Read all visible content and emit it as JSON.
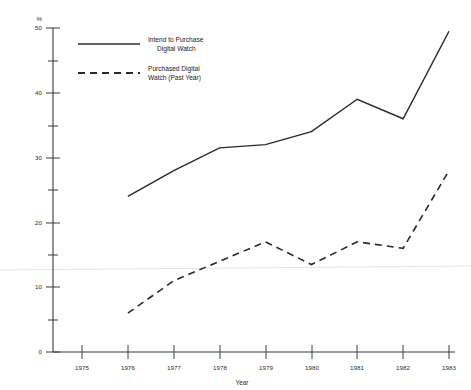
{
  "chart_data": {
    "type": "line",
    "title": "",
    "xlabel": "Year",
    "ylabel": "%",
    "x": [
      1975,
      1976,
      1977,
      1978,
      1979,
      1980,
      1981,
      1982,
      1983
    ],
    "xtick_labels": [
      "1975",
      "1976",
      "1977",
      "1978",
      "1979",
      "1980",
      "1981",
      "1982",
      "1983"
    ],
    "ytick_labels": [
      "0",
      "10",
      "20",
      "30",
      "40",
      "50"
    ],
    "yticks": [
      0,
      10,
      20,
      30,
      40,
      50
    ],
    "yminor_ticks": [
      5,
      15,
      25,
      35,
      45
    ],
    "ylim": [
      0,
      50
    ],
    "xlim": [
      1975,
      1983
    ],
    "grid": false,
    "legend_position": "top-left-inside",
    "series": [
      {
        "name": "Intend to Purchase Digital Watch",
        "style": "solid",
        "x": [
          1976,
          1977,
          1978,
          1979,
          1980,
          1981,
          1982,
          1983
        ],
        "values": [
          24,
          28,
          31.5,
          32,
          34,
          39,
          36,
          49.5
        ]
      },
      {
        "name": "Purchased Digital Watch (Past Year)",
        "style": "dashed",
        "x": [
          1976,
          1977,
          1978,
          1979,
          1980,
          1981,
          1982,
          1983
        ],
        "values": [
          6,
          11,
          14,
          17,
          13.5,
          17,
          16,
          28
        ]
      }
    ]
  },
  "axes": {
    "y_unit_label": "%",
    "x_axis_title": "Year",
    "y_tick_0": "0",
    "y_tick_10": "10",
    "y_tick_20": "20",
    "y_tick_30": "30",
    "y_tick_40": "40",
    "y_tick_50": "50",
    "x_tick_1975": "1975",
    "x_tick_1976": "1976",
    "x_tick_1977": "1977",
    "x_tick_1978": "1978",
    "x_tick_1979": "1979",
    "x_tick_1980": "1980",
    "x_tick_1981": "1981",
    "x_tick_1982": "1982",
    "x_tick_1983": "1983"
  },
  "legend": {
    "items": [
      {
        "line1": "Intend to Purchase",
        "line2": "Digital Watch",
        "style": "solid"
      },
      {
        "line1": "Purchased Digital",
        "line2": "Watch (Past Year)",
        "style": "dashed"
      }
    ]
  },
  "colors": {
    "line": "#2a2a2a",
    "axis": "#3a3a3a",
    "background": "#ffffff",
    "text": "#1a1a1a"
  }
}
